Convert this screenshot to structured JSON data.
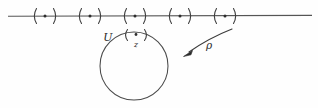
{
  "figure": {
    "type": "mathematical-diagram",
    "canvas": {
      "width": 318,
      "height": 108
    },
    "background_color": "#fefefe",
    "ink_color": "#4a4a4a"
  },
  "axis": {
    "name": "horizontal-line",
    "x_start": 8,
    "x_end": 312,
    "y": 16,
    "color": "#555555"
  },
  "neighborhoods_on_line": [
    {
      "id": "nbhd-1",
      "cx": 45,
      "cy": 16,
      "symbol": "(·)",
      "half_width": 13
    },
    {
      "id": "nbhd-2",
      "cx": 90,
      "cy": 16,
      "symbol": "(·)",
      "half_width": 13
    },
    {
      "id": "nbhd-3",
      "cx": 135,
      "cy": 16,
      "symbol": "(·)",
      "half_width": 13
    },
    {
      "id": "nbhd-4",
      "cx": 180,
      "cy": 16,
      "symbol": "(·)",
      "half_width": 13
    },
    {
      "id": "nbhd-5",
      "cx": 225,
      "cy": 16,
      "symbol": "(·)",
      "half_width": 13
    }
  ],
  "circle": {
    "name": "set-U",
    "cx": 134,
    "cy": 66,
    "r": 34,
    "color": "#4a4a4a"
  },
  "labels": {
    "u": "U",
    "z": "z",
    "rho": "ρ"
  },
  "label_positions": {
    "u": {
      "x": 111,
      "y": 40
    },
    "z": {
      "x": 133,
      "y": 48
    },
    "rho": {
      "x": 208,
      "y": 49
    }
  },
  "inner_neighborhood": {
    "id": "nbhd-z",
    "cx": 136,
    "cy": 35,
    "symbol": "(·)",
    "half_width": 12
  },
  "arrow": {
    "name": "rho-map-arrow",
    "from": {
      "x": 231,
      "y": 29
    },
    "ctrl": {
      "x": 205,
      "y": 40
    },
    "to": {
      "x": 184,
      "y": 55
    },
    "color": "#2b2b2b"
  }
}
